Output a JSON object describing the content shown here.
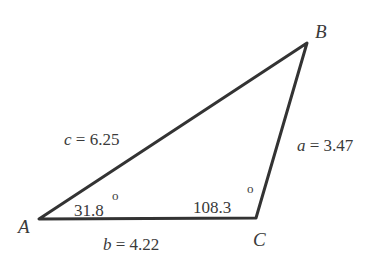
{
  "diagram": {
    "type": "triangle",
    "vertices": [
      {
        "name": "A",
        "label": "A",
        "x": 39,
        "y": 219
      },
      {
        "name": "B",
        "label": "B",
        "x": 307,
        "y": 43
      },
      {
        "name": "C",
        "label": "C",
        "x": 256,
        "y": 218
      }
    ],
    "sides": {
      "a": {
        "var": "a",
        "eq": " = ",
        "value": "3.47",
        "between": [
          "B",
          "C"
        ]
      },
      "b": {
        "var": "b",
        "eq": " = ",
        "value": "4.22",
        "between": [
          "A",
          "C"
        ]
      },
      "c": {
        "var": "c",
        "eq": " = ",
        "value": "6.25",
        "between": [
          "A",
          "B"
        ]
      }
    },
    "angles": {
      "A": {
        "value": "31.8",
        "unit": "o"
      },
      "C": {
        "value": "108.3",
        "unit": "o"
      }
    },
    "colors": {
      "stroke": "#333333",
      "text": "#3a3a3a",
      "background": "#ffffff"
    }
  }
}
